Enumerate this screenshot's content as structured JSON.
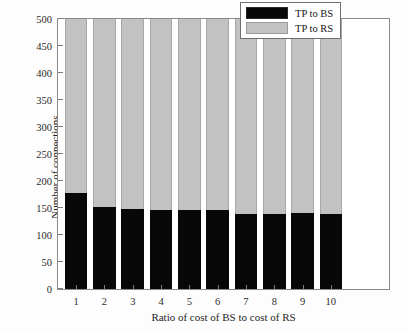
{
  "chart_data": {
    "type": "bar",
    "stacked": true,
    "title": "",
    "xlabel": "Ratio of cost of BS to cost of RS",
    "ylabel": "Number of connections",
    "categories": [
      "1",
      "2",
      "3",
      "4",
      "5",
      "6",
      "7",
      "8",
      "9",
      "10"
    ],
    "ylim": [
      0,
      500
    ],
    "yticks": [
      "0",
      "50",
      "100",
      "150",
      "200",
      "250",
      "300",
      "350",
      "400",
      "450",
      "500"
    ],
    "ytick_values": [
      0,
      50,
      100,
      150,
      200,
      250,
      300,
      350,
      400,
      450,
      500
    ],
    "grid": false,
    "legend_position": "top-right",
    "series": [
      {
        "name": "TP to BS",
        "color": "#080808",
        "values": [
          178,
          151,
          148,
          146,
          147,
          147,
          139,
          139,
          141,
          138
        ]
      },
      {
        "name": "TP to RS",
        "color": "#c2c2c2",
        "values": [
          322,
          349,
          352,
          354,
          353,
          353,
          361,
          361,
          359,
          362
        ]
      }
    ],
    "totals": [
      500,
      500,
      500,
      500,
      500,
      500,
      500,
      500,
      500,
      500
    ]
  },
  "legend": {
    "entries": [
      {
        "label": "TP to BS",
        "swatch": "black"
      },
      {
        "label": "TP to RS",
        "swatch": "gray"
      }
    ]
  },
  "colors": {
    "series_bs": "#080808",
    "series_rs": "#c2c2c2",
    "axis": "#8a8a8a",
    "background": "#ffffff"
  }
}
